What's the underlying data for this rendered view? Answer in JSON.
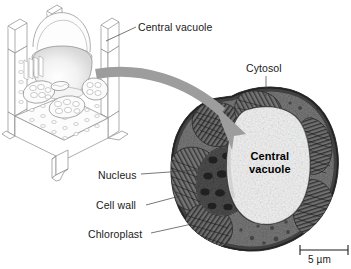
{
  "figure": {
    "type": "biology-diagram",
    "background_color": "#ffffff",
    "ink_color": "#1a1a1a",
    "arrow_color": "#9a9a9a"
  },
  "labels": {
    "central_vacuole_top": "Central vacuole",
    "cytosol": "Cytosol",
    "nucleus": "Nucleus",
    "cell_wall": "Cell wall",
    "chloroplast": "Chloroplast",
    "central_vacuole_inner_line1": "Central",
    "central_vacuole_inner_line2": "vacuole",
    "scale_bar": "5 µm"
  },
  "panels": {
    "left": {
      "name": "plant-cell-line-drawing",
      "style": "three-dimensional outline illustration",
      "organelles": [
        "cell wall",
        "central vacuole",
        "chloroplast",
        "nucleus",
        "cytosol"
      ]
    },
    "right": {
      "name": "plant-cell-electron-micrograph",
      "style": "grayscale transmission electron micrograph",
      "scale_bar_value": "5 µm"
    }
  }
}
